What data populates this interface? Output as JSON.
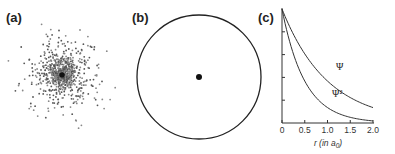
{
  "panels": {
    "a": {
      "label": "(a)",
      "description": "electron probability dot density cloud"
    },
    "b": {
      "label": "(b)",
      "description": "circle boundary with central nucleus dot"
    },
    "c": {
      "label": "(c)"
    }
  },
  "chart_data": {
    "type": "line",
    "title": "",
    "xlabel": "r (in a0)",
    "xlabel_main": "r (in a",
    "xlabel_sub": "0",
    "xlabel_close": ")",
    "ylabel": "",
    "xlim": [
      0,
      2.0
    ],
    "ylim": [
      0,
      1.0
    ],
    "x_ticks": [
      "0",
      "0.5",
      "1.0",
      "1.5",
      "2.0"
    ],
    "grid": false,
    "series": [
      {
        "name": "Ψ",
        "label": "Ψ",
        "x": [
          0,
          0.25,
          0.5,
          0.75,
          1.0,
          1.25,
          1.5,
          1.75,
          2.0
        ],
        "values": [
          1.0,
          0.78,
          0.61,
          0.47,
          0.37,
          0.29,
          0.22,
          0.17,
          0.14
        ]
      },
      {
        "name": "Ψ²",
        "label": "Ψ²",
        "x": [
          0,
          0.25,
          0.5,
          0.75,
          1.0,
          1.25,
          1.5,
          1.75,
          2.0
        ],
        "values": [
          1.0,
          0.61,
          0.37,
          0.22,
          0.14,
          0.08,
          0.05,
          0.03,
          0.02
        ]
      }
    ]
  }
}
